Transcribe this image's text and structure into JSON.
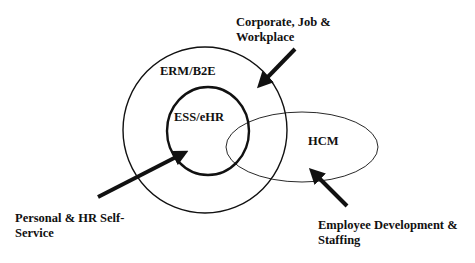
{
  "diagram": {
    "sets": [
      {
        "id": "erm",
        "label": "ERM/B2E"
      },
      {
        "id": "ess",
        "label": "ESS/eHR"
      },
      {
        "id": "hcm",
        "label": "HCM"
      }
    ],
    "callouts": [
      {
        "id": "corporate",
        "line1": "Corporate, Job &",
        "line2": "Workplace",
        "points_to": "ERM/B2E"
      },
      {
        "id": "personal",
        "line1": "Personal & HR Self-",
        "line2": "Service",
        "points_to": "ESS/eHR"
      },
      {
        "id": "employee",
        "line1": "Employee Development &",
        "line2": "Staffing",
        "points_to": "HCM"
      }
    ],
    "colors": {
      "stroke": "#111111",
      "background": "#ffffff"
    }
  }
}
